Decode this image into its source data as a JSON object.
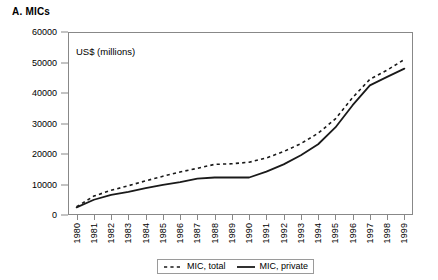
{
  "panel": {
    "title": "A. MICs",
    "units_note": "US$ (millions)"
  },
  "legend": {
    "position": "bottom-center",
    "entries": [
      {
        "label": "MIC, total",
        "style": "dashed",
        "color": "#1a1a1a"
      },
      {
        "label": "MIC, private",
        "style": "solid",
        "color": "#1a1a1a"
      }
    ]
  },
  "axes": {
    "y_ticks": [
      "0",
      "10000",
      "20000",
      "30000",
      "40000",
      "50000",
      "60000"
    ],
    "x_ticks": [
      "1980",
      "1981",
      "1982",
      "1983",
      "1984",
      "1985",
      "1986",
      "1987",
      "1988",
      "1989",
      "1990",
      "1991",
      "1992",
      "1993",
      "1994",
      "1995",
      "1996",
      "1997",
      "1998",
      "1999"
    ]
  },
  "chart_data": {
    "type": "line",
    "title": "A. MICs",
    "xlabel": "",
    "ylabel": "US$ (millions)",
    "ylim": [
      0,
      60000
    ],
    "ytick_step": 10000,
    "grid": false,
    "legend_position": "bottom-center",
    "annotations": [
      "US$ (millions)"
    ],
    "categories": [
      "1980",
      "1981",
      "1982",
      "1983",
      "1984",
      "1985",
      "1986",
      "1987",
      "1988",
      "1989",
      "1990",
      "1991",
      "1992",
      "1993",
      "1994",
      "1995",
      "1996",
      "1997",
      "1998",
      "1999"
    ],
    "series": [
      {
        "name": "MIC, total",
        "style": "dashed",
        "values": [
          2700,
          6200,
          8100,
          9600,
          11200,
          12700,
          14100,
          15300,
          16600,
          16800,
          17300,
          18700,
          20800,
          23400,
          26800,
          31500,
          38500,
          44500,
          47500,
          51000
        ]
      },
      {
        "name": "MIC, private",
        "style": "solid",
        "values": [
          2500,
          5000,
          6600,
          7600,
          8800,
          9900,
          10800,
          11900,
          12300,
          12300,
          12300,
          14200,
          16600,
          19600,
          23200,
          28700,
          36000,
          42500,
          45300,
          48000
        ]
      }
    ]
  }
}
